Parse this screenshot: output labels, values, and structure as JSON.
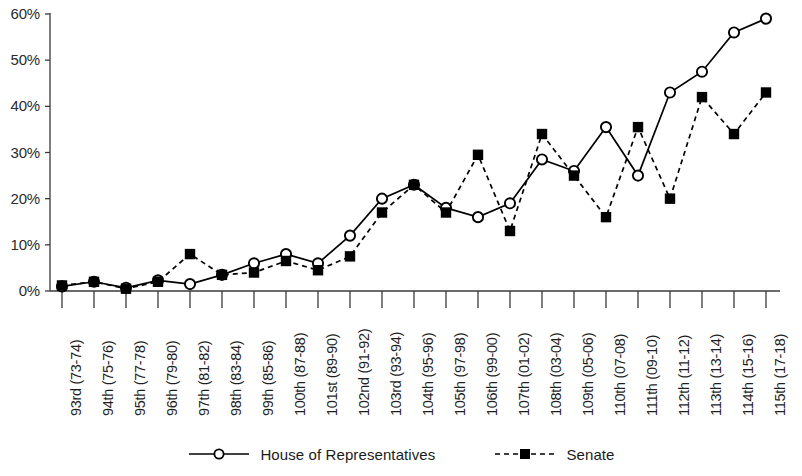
{
  "chart_data": {
    "type": "line",
    "title": "",
    "xlabel": "",
    "ylabel": "",
    "ylim": [
      0,
      60
    ],
    "grid": false,
    "legend_position": "bottom",
    "ytick_labels": [
      "60%",
      "50%",
      "40%",
      "30%",
      "20%",
      "10%",
      "0%"
    ],
    "ytick_values": [
      60,
      50,
      40,
      30,
      20,
      10,
      0
    ],
    "categories": [
      "93rd (73-74)",
      "94th (75-76)",
      "95th (77-78)",
      "96th (79-80)",
      "97th (81-82)",
      "98th (83-84)",
      "99th (85-86)",
      "100th (87-88)",
      "101st (89-90)",
      "102nd (91-92)",
      "103rd (93-94)",
      "104th (95-96)",
      "105th (97-98)",
      "106th (99-00)",
      "107th (01-02)",
      "108th (03-04)",
      "109th (05-06)",
      "110th (07-08)",
      "111th (09-10)",
      "112th (11-12)",
      "113th (13-14)",
      "114th (15-16)",
      "115th (17-18)"
    ],
    "series": [
      {
        "name": "House of Representatives",
        "marker": "open-circle",
        "line_style": "solid",
        "color": "#000000",
        "values": [
          1,
          2,
          0.7,
          2.3,
          1.5,
          3.5,
          6,
          8,
          6,
          12,
          20,
          23,
          18,
          16,
          19,
          28.5,
          26,
          35.5,
          25,
          43,
          47.5,
          56,
          59
        ]
      },
      {
        "name": "Senate",
        "marker": "filled-square",
        "line_style": "dashed",
        "color": "#000000",
        "values": [
          1.2,
          2,
          0.5,
          2,
          8,
          3.5,
          4,
          6.5,
          4.5,
          7.5,
          17,
          23,
          17,
          29.5,
          13,
          34,
          25,
          16,
          35.5,
          20,
          42,
          34,
          43
        ]
      }
    ]
  },
  "legend": {
    "items": [
      {
        "label": "House of Representatives",
        "key": "open-circle-solid-line"
      },
      {
        "label": "Senate",
        "key": "filled-square-dashed-line"
      }
    ]
  }
}
